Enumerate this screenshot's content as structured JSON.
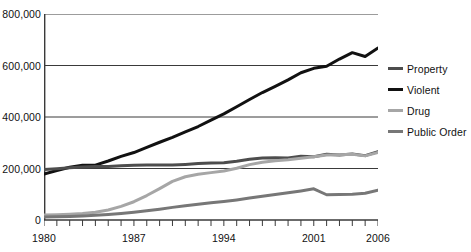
{
  "chart_data": {
    "type": "line",
    "title": "",
    "xlabel": "",
    "ylabel": "",
    "xlim": [
      1980,
      2006
    ],
    "ylim": [
      0,
      800000
    ],
    "grid": true,
    "gridlines": [
      0,
      200000,
      400000,
      600000,
      800000
    ],
    "ytick_labels": [
      "0",
      "200,000",
      "400,000",
      "600,000",
      "800,000"
    ],
    "xtick_labels": [
      "1980",
      "1987",
      "1994",
      "2001",
      "2006"
    ],
    "xtick_values": [
      1980,
      1987,
      1994,
      2001,
      2006
    ],
    "x_minor_ticks_every": 1,
    "legend_position": "right",
    "x": [
      1980,
      1981,
      1982,
      1983,
      1984,
      1985,
      1986,
      1987,
      1988,
      1989,
      1990,
      1991,
      1992,
      1993,
      1994,
      1995,
      1996,
      1997,
      1998,
      1999,
      2000,
      2001,
      2002,
      2003,
      2004,
      2005,
      2006
    ],
    "series": [
      {
        "name": "Violent",
        "color": "#111111",
        "width": 3.0,
        "values": [
          178000,
          192000,
          205000,
          213000,
          213000,
          229000,
          247000,
          262000,
          282000,
          302000,
          321000,
          342000,
          363000,
          388000,
          412000,
          440000,
          468000,
          495000,
          519000,
          544000,
          572000,
          589000,
          597000,
          625000,
          650000,
          635000,
          668000
        ]
      },
      {
        "name": "Property",
        "color": "#4d4d4d",
        "width": 3.0,
        "values": [
          196000,
          199000,
          203000,
          206000,
          208000,
          208000,
          211000,
          213000,
          214000,
          214000,
          214000,
          216000,
          219000,
          221000,
          222000,
          228000,
          236000,
          241000,
          242000,
          241000,
          248000,
          246000,
          255000,
          252000,
          256000,
          250000,
          265000
        ]
      },
      {
        "name": "Drug",
        "color": "#a6a6a6",
        "width": 3.0,
        "values": [
          19000,
          20000,
          22000,
          25000,
          30000,
          39000,
          53000,
          71000,
          95000,
          122000,
          150000,
          168000,
          178000,
          184000,
          190000,
          201000,
          215000,
          224000,
          230000,
          234000,
          240000,
          246000,
          252000,
          253000,
          255000,
          249000,
          262000
        ]
      },
      {
        "name": "Public Order",
        "color": "#777777",
        "width": 3.0,
        "values": [
          12000,
          13000,
          14000,
          16000,
          18000,
          21000,
          25000,
          30000,
          36000,
          42000,
          49000,
          55000,
          61000,
          67000,
          72000,
          78000,
          85000,
          92000,
          99000,
          106000,
          113000,
          121000,
          98000,
          99000,
          100000,
          104000,
          116000
        ]
      }
    ],
    "legend": [
      {
        "label": "Property",
        "color": "#4d4d4d"
      },
      {
        "label": "Violent",
        "color": "#111111"
      },
      {
        "label": "Drug",
        "color": "#a6a6a6"
      },
      {
        "label": "Public Order",
        "color": "#777777"
      }
    ]
  }
}
